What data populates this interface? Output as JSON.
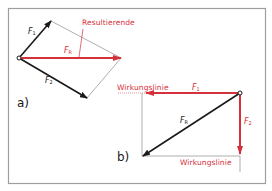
{
  "diagram": {
    "colors": {
      "red": "#d6303a",
      "black": "#1a1a1a",
      "gray": "#9a9a9a",
      "frame": "#9e9e9e"
    },
    "part_a": {
      "label": "a)",
      "annotation": "Resultierende",
      "forces": [
        {
          "name": "F",
          "sub": "1"
        },
        {
          "name": "F",
          "sub": "2"
        },
        {
          "name": "F",
          "sub": "R"
        }
      ]
    },
    "part_b": {
      "label": "b)",
      "line_of_action_top": "Wirkungslinie",
      "line_of_action_bottom": "Wirkungslinie",
      "forces": [
        {
          "name": "F",
          "sub": "1"
        },
        {
          "name": "F",
          "sub": "2"
        },
        {
          "name": "F",
          "sub": "R"
        }
      ]
    }
  }
}
